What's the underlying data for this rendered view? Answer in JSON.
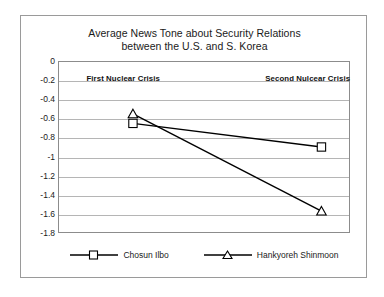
{
  "chart_data": {
    "type": "line",
    "title": "Average News Tone about Security Relations between the U.S. and S. Korea",
    "title_line1": "Average News Tone about Security Relations",
    "title_line2": "between the U.S. and S. Korea",
    "xlabel": "",
    "ylabel": "",
    "categories": [
      "First Nulcear Crisis",
      "Second Nulcear Crisis"
    ],
    "category_labels_displayed": [
      "First Nuclear Crisis",
      "Second Nulcear Crisis"
    ],
    "ylim": [
      -1.8,
      0
    ],
    "y_inverted": true,
    "y_ticks": [
      0,
      -0.2,
      -0.4,
      -0.6,
      -0.8,
      -1,
      -1.2,
      -1.4,
      -1.6,
      -1.8
    ],
    "y_tick_labels": [
      "0",
      "-0.2",
      "-0.4",
      "-0.6",
      "-0.8",
      "-1",
      "-1.2",
      "-1.4",
      "-1.6",
      "-1.8"
    ],
    "grid": true,
    "grid_axis": "y",
    "legend_position": "bottom",
    "series": [
      {
        "name": "Chosun Ilbo",
        "marker": "open-square",
        "values": [
          -0.65,
          -0.9
        ]
      },
      {
        "name": "Hankyoreh Shinmoon",
        "marker": "open-triangle",
        "values": [
          -0.55,
          -1.58
        ]
      }
    ],
    "annotations": [
      {
        "text": "First Nuclear Crisis",
        "x_category": 0
      },
      {
        "text": "Second Nulcear Crisis",
        "x_category": 1
      }
    ],
    "colors": {
      "line": "#000000",
      "grid": "#b5b5b5",
      "axis": "#8c8c8c",
      "background": "#ffffff",
      "text": "#1a1a1a",
      "frame": "#9a9a9a"
    }
  },
  "legend": {
    "items": [
      {
        "label": "Chosun Ilbo"
      },
      {
        "label": "Hankyoreh Shinmoon"
      }
    ]
  }
}
